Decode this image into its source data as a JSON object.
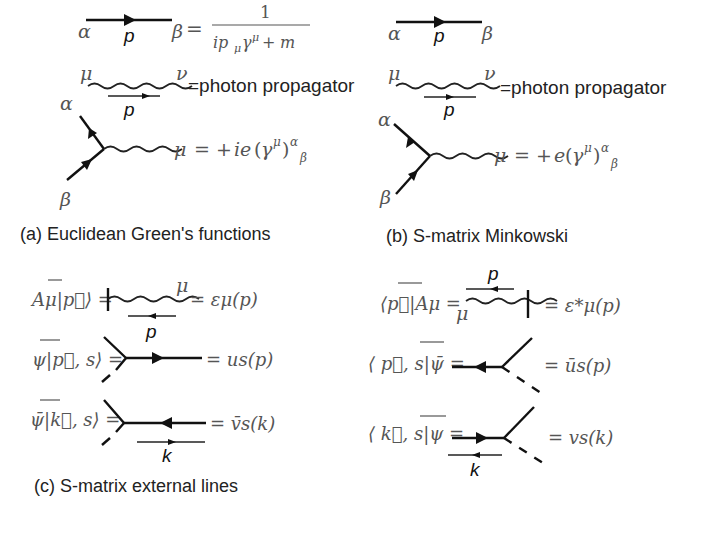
{
  "panels": {
    "a": {
      "caption": "(a) Euclidean Green's functions",
      "propagator": {
        "left": "α",
        "momentum": "p",
        "right": "β",
        "equals": "=",
        "numerator": "1",
        "denominator": "ipμγμ + m"
      },
      "photon": {
        "left": "μ",
        "right": "ν",
        "momentum": "p",
        "label": "=photon propagator"
      },
      "vertex": {
        "top": "α",
        "bottom": "β",
        "rhs": "μ = +ie(γμ)αβ"
      }
    },
    "b": {
      "caption": "(b) S-matrix Minkowski",
      "propagator": {
        "left": "α",
        "momentum": "p",
        "right": "β"
      },
      "photon": {
        "left": "μ",
        "right": "ν",
        "momentum": "p",
        "label": "=photon propagator"
      },
      "vertex": {
        "top": "α",
        "bottom": "β",
        "rhs": "μ = +e(γμ)αβ"
      }
    },
    "c": {
      "caption": "(c) S-matrix external lines",
      "left": [
        {
          "lhs": "Aμ|p⃗⟩ =",
          "index": "μ",
          "rhs": "= εμ(p)",
          "momentum": "p"
        },
        {
          "lhs": "ψ|p⃗, s⟩ =",
          "rhs": "= us(p)"
        },
        {
          "lhs": "ψ̄|k⃗, s⟩ =",
          "rhs": "= v̄s(k)",
          "momentum": "k"
        }
      ],
      "right": [
        {
          "lhs": "⟨p⃗|Aμ =",
          "index": "μ",
          "rhs": "= ε*μ(p)",
          "momentum": "p"
        },
        {
          "lhs": "⟨ p⃗, s|ψ̄ =",
          "rhs": "= ūs(p)"
        },
        {
          "lhs": "⟨ k⃗, s|ψ =",
          "rhs": "= vs(k)",
          "momentum": "k"
        }
      ]
    }
  }
}
